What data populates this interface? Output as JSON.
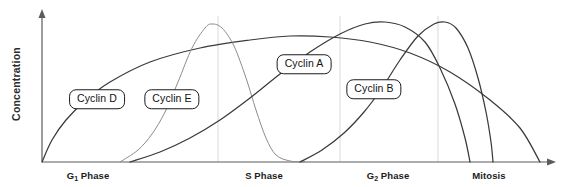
{
  "figure": {
    "background": "#ffffff",
    "axis_color": "#5b5b5b",
    "gridline_color": "#d9d9d9",
    "curve_color_dark": "#3a3a3a",
    "curve_color_light": "#8c8c8c",
    "label_border_color": "#1a1a1a"
  },
  "axes": {
    "y_title": "Concentration",
    "x_tick_labels": [
      {
        "label_prefix": "G",
        "label_sub": "1",
        "label_suffix": " Phase",
        "full": "G1 Phase",
        "x": 88
      },
      {
        "label_prefix": "",
        "label_sub": "",
        "label_suffix": "S Phase",
        "full": "S Phase",
        "x": 264
      },
      {
        "label_prefix": "G",
        "label_sub": "2",
        "label_suffix": " Phase",
        "full": "G2 Phase",
        "x": 388
      },
      {
        "label_prefix": "",
        "label_sub": "",
        "label_suffix": "Mitosis",
        "full": "Mitosis",
        "x": 489
      }
    ]
  },
  "curve_labels": [
    {
      "name": "Cyclin D",
      "x": 97,
      "y": 99
    },
    {
      "name": "Cyclin E",
      "x": 172,
      "y": 99
    },
    {
      "name": "Cyclin A",
      "x": 304,
      "y": 64
    },
    {
      "name": "Cyclin B",
      "x": 374,
      "y": 89
    }
  ],
  "chart_data": {
    "type": "line",
    "title": "",
    "xlabel": "",
    "ylabel": "Concentration",
    "grid": true,
    "legend": "inline-callout-boxes",
    "x_categories": [
      "G1 Phase",
      "S Phase",
      "G2 Phase",
      "Mitosis"
    ],
    "x_category_positions_px": [
      88,
      264,
      388,
      489
    ],
    "gridlines_px": [
      218,
      340,
      438
    ],
    "axis_origin_px": {
      "x": 42,
      "y": 162
    },
    "axis_extent_px": {
      "x": 553,
      "y": 12
    },
    "series": [
      {
        "name": "Cyclin D",
        "style": "dark",
        "description": "Broad low arc rising through G1, flat maximum across S/G2, declining to baseline at end of mitosis",
        "points_px": [
          [
            42,
            162
          ],
          [
            52,
            140
          ],
          [
            66,
            120
          ],
          [
            86,
            100
          ],
          [
            110,
            82
          ],
          [
            150,
            62
          ],
          [
            200,
            48
          ],
          [
            250,
            40
          ],
          [
            290,
            36
          ],
          [
            330,
            37
          ],
          [
            370,
            42
          ],
          [
            410,
            53
          ],
          [
            450,
            72
          ],
          [
            490,
            100
          ],
          [
            520,
            128
          ],
          [
            540,
            162
          ]
        ]
      },
      {
        "name": "Cyclin E",
        "style": "light",
        "description": "Rises sharply late in G1, sharp peak at G1/S boundary, falls steeply through S phase to baseline",
        "points_px": [
          [
            120,
            162
          ],
          [
            138,
            150
          ],
          [
            152,
            134
          ],
          [
            165,
            112
          ],
          [
            178,
            82
          ],
          [
            192,
            48
          ],
          [
            205,
            28
          ],
          [
            212,
            24
          ],
          [
            222,
            28
          ],
          [
            234,
            46
          ],
          [
            246,
            78
          ],
          [
            256,
            110
          ],
          [
            266,
            138
          ],
          [
            276,
            155
          ],
          [
            290,
            161
          ],
          [
            305,
            162
          ]
        ]
      },
      {
        "name": "Cyclin A",
        "style": "dark",
        "description": "Rises steadily from early S phase, broad peak in G2, falls steeply to baseline in mitosis",
        "points_px": [
          [
            130,
            162
          ],
          [
            160,
            152
          ],
          [
            190,
            138
          ],
          [
            220,
            120
          ],
          [
            250,
            98
          ],
          [
            280,
            74
          ],
          [
            310,
            52
          ],
          [
            340,
            34
          ],
          [
            365,
            24
          ],
          [
            385,
            22
          ],
          [
            405,
            27
          ],
          [
            425,
            42
          ],
          [
            440,
            68
          ],
          [
            455,
            104
          ],
          [
            465,
            138
          ],
          [
            470,
            162
          ]
        ]
      },
      {
        "name": "Cyclin B",
        "style": "dark",
        "description": "Rises through G2, sharp peak at start of mitosis, abrupt drop to baseline at end of mitosis",
        "points_px": [
          [
            300,
            162
          ],
          [
            322,
            150
          ],
          [
            344,
            133
          ],
          [
            364,
            112
          ],
          [
            382,
            88
          ],
          [
            400,
            60
          ],
          [
            418,
            36
          ],
          [
            434,
            24
          ],
          [
            445,
            22
          ],
          [
            456,
            28
          ],
          [
            468,
            48
          ],
          [
            478,
            78
          ],
          [
            486,
            112
          ],
          [
            491,
            142
          ],
          [
            493,
            162
          ]
        ]
      }
    ]
  }
}
